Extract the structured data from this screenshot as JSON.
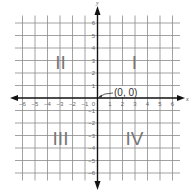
{
  "plane": {
    "x_axis_label": "x",
    "y_axis_label": "y",
    "x_ticks": [
      "-6",
      "-5",
      "-4",
      "-3",
      "-2",
      "-1",
      "0",
      "1",
      "2",
      "3",
      "4",
      "5",
      "6"
    ],
    "y_ticks_positive": [
      "1",
      "2",
      "3",
      "4",
      "5",
      "6"
    ],
    "y_ticks_negative": [
      "-1",
      "-2",
      "-3",
      "-4",
      "-5",
      "-6"
    ],
    "origin_label": "(0, 0)",
    "quadrants": {
      "q1": "I",
      "q2": "II",
      "q3": "III",
      "q4": "IV"
    },
    "range": {
      "xmin": -6,
      "xmax": 6,
      "ymin": -6,
      "ymax": 6
    },
    "colors": {
      "grid": "#8a8a8a",
      "axis": "#111111",
      "quadrant_text": "#777777",
      "label_text": "#333333"
    }
  }
}
